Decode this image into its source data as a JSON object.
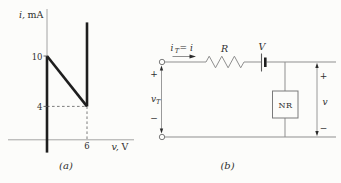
{
  "figure": {
    "panel_a": {
      "caption": "(a)",
      "y_axis": {
        "variable": "i,",
        "unit": "mA"
      },
      "x_axis": {
        "variable": "v,",
        "unit": "V"
      },
      "y_tick_labels": [
        "10",
        "4"
      ],
      "x_tick_labels": [
        "6"
      ]
    },
    "panel_b": {
      "caption": "(b)",
      "current_label": {
        "base": "i",
        "sub": "T",
        "eq": "= i"
      },
      "resistor_label": "R",
      "source_label": "V",
      "nonlinear_resistor_label": "NR",
      "port_voltage": {
        "base": "v",
        "sub": "T",
        "plus": "+",
        "minus": "−"
      },
      "output_voltage": {
        "label": "v",
        "plus": "+",
        "minus": "−"
      }
    }
  },
  "chart_data": {
    "type": "line",
    "title": "",
    "xlabel": "v, V",
    "ylabel": "i, mA",
    "xlim": [
      -1,
      13
    ],
    "ylim": [
      -2,
      15.5
    ],
    "grid": false,
    "x_ticks": [
      6
    ],
    "y_ticks": [
      10,
      4
    ],
    "segments": [
      {
        "name": "vertical-branch-at-v0",
        "points": [
          [
            0,
            -1.5
          ],
          [
            0,
            10
          ]
        ]
      },
      {
        "name": "descending-branch",
        "points": [
          [
            0,
            10
          ],
          [
            6,
            4
          ]
        ]
      },
      {
        "name": "vertical-branch-at-v6",
        "points": [
          [
            6,
            4
          ],
          [
            6,
            14
          ]
        ]
      }
    ],
    "guides": [
      [
        [
          0,
          4
        ],
        [
          6,
          4
        ]
      ],
      [
        [
          6,
          4
        ],
        [
          6,
          0
        ]
      ]
    ]
  }
}
